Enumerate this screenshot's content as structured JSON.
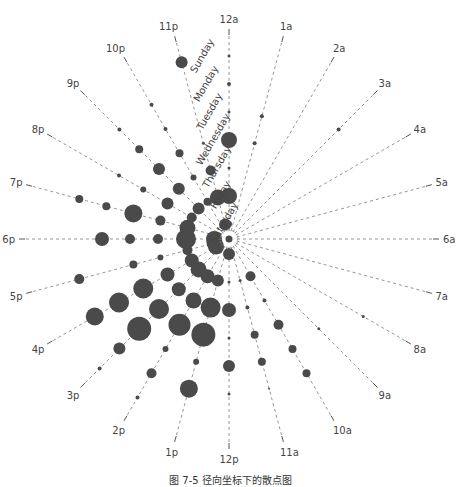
{
  "chart_data": {
    "type": "scatter",
    "subtype": "radial-bubble",
    "title": "",
    "caption": "图 7-5  径向坐标下的散点图",
    "hours": [
      "12a",
      "1a",
      "2a",
      "3a",
      "4a",
      "5a",
      "6a",
      "7a",
      "8a",
      "9a",
      "10a",
      "11a",
      "12p",
      "1p",
      "2p",
      "3p",
      "4p",
      "5p",
      "6p",
      "7p",
      "8p",
      "9p",
      "10p",
      "11p"
    ],
    "days": [
      "Sunday",
      "Monday",
      "Tuesday",
      "Wednesday",
      "Thursday",
      "Friday",
      "Saturday"
    ],
    "ring_radius": {
      "Sunday": 183,
      "Monday": 155,
      "Tuesday": 127,
      "Wednesday": 99,
      "Thursday": 71,
      "Friday": 43,
      "Saturday": 15
    },
    "center": [
      229,
      239
    ],
    "axis_length": 205,
    "label_radius": 220,
    "bubble_radius_px": {
      "Sunday": [
        1.5,
        0,
        0,
        0,
        0,
        0,
        0,
        0,
        0,
        0,
        0,
        0,
        0,
        0,
        2,
        2,
        0,
        0,
        0,
        0,
        0,
        0,
        0,
        6
      ],
      "Monday": [
        2,
        0,
        0,
        2,
        0,
        0,
        0,
        0,
        1.5,
        0,
        4,
        1,
        1.5,
        9,
        5,
        6,
        9,
        5,
        0,
        4,
        0,
        2,
        2,
        0
      ],
      "Tuesday": [
        1.5,
        2,
        0,
        0,
        0,
        0,
        0,
        0,
        0,
        1.5,
        4,
        4,
        6,
        3,
        3,
        12,
        10,
        0,
        7,
        4,
        2,
        4,
        2,
        0
      ],
      "Wednesday": [
        8,
        2,
        0,
        0,
        0,
        0,
        0,
        0,
        0,
        0,
        5,
        4,
        1.5,
        12,
        11,
        10,
        10,
        4,
        5,
        9,
        3,
        6,
        4,
        1.5
      ],
      "Thursday": [
        1.5,
        0,
        0,
        0,
        0,
        0,
        0,
        0,
        0,
        0,
        2,
        2,
        7,
        10,
        8,
        7,
        7,
        3,
        5,
        5,
        6,
        6,
        3,
        5
      ],
      "Friday": [
        8,
        0,
        0,
        0,
        0,
        0,
        0,
        0,
        0,
        0,
        5,
        1.5,
        1.5,
        6,
        7,
        8,
        7,
        5,
        10,
        8,
        5,
        6,
        4,
        8
      ],
      "Saturday": [
        3,
        0,
        0,
        0,
        0,
        0,
        0,
        0,
        0,
        0,
        0,
        0,
        6,
        0,
        0,
        0,
        8,
        8,
        8,
        0,
        0,
        0,
        0,
        6
      ]
    },
    "xlabel": "Hour of day (angular)",
    "ylabel": "Day of week (radial)",
    "grid": true,
    "legend": null
  }
}
